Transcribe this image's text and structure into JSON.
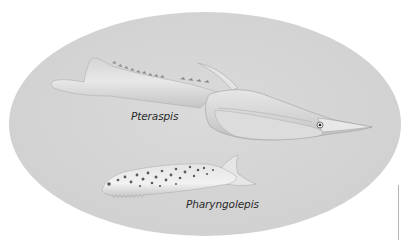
{
  "illustration": {
    "background_color": "#ffffff",
    "ellipse_color": "#d6d6d6",
    "fish": [
      {
        "name": "Pteraspis",
        "label": "Pteraspis",
        "body_color": "#e2e2e2",
        "shade_color": "#b8b8b8"
      },
      {
        "name": "Pharyngolepis",
        "label": "Pharyngolepis",
        "body_color": "#ececec",
        "spot_color": "#555555"
      }
    ]
  }
}
